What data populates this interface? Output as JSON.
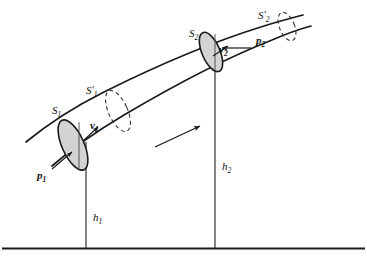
{
  "figure": {
    "background_color": "#ffffff",
    "line_color": "#1a1a1a",
    "fill_color": "#d3d3d3",
    "dashed_color": "#333333"
  },
  "labels": {
    "s1": {
      "base": "S",
      "subscript": "1",
      "prime": ""
    },
    "s1_prime": {
      "base": "S",
      "subscript": "1",
      "prime": "′"
    },
    "s2": {
      "base": "S",
      "subscript": "2",
      "prime": ""
    },
    "s2_prime": {
      "base": "S",
      "subscript": "2",
      "prime": "′"
    },
    "p1": {
      "base": "p",
      "subscript": "1"
    },
    "p2": {
      "base": "p",
      "subscript": "2"
    },
    "v1": {
      "base": "v",
      "subscript": "1"
    },
    "v2": {
      "base": "v",
      "subscript": "2"
    },
    "h1": {
      "base": "h",
      "subscript": "1"
    },
    "h2": {
      "base": "h",
      "subscript": "2"
    }
  },
  "elements": {
    "ground_line": "ground-reference-line",
    "height_line_1": "height-h1-vertical-line",
    "height_line_2": "height-h2-vertical-line",
    "flow_arrow": "flow-direction-arrow",
    "tube_upper_wall": "tube-upper-wall",
    "tube_lower_wall": "tube-lower-wall",
    "cross_section_1": "shaded-cross-section-s1",
    "cross_section_2": "shaded-cross-section-s2",
    "dashed_section_1": "dashed-cross-section-s1-prime",
    "dashed_section_2": "dashed-cross-section-s2-prime"
  }
}
